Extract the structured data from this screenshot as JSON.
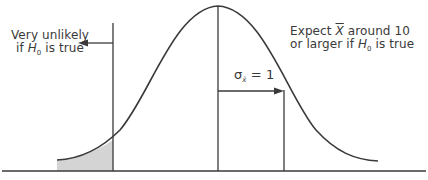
{
  "diagram": {
    "type": "normal-distribution-sampling",
    "left_annotation": {
      "line1": "Very unlikely",
      "line2_prefix": "if ",
      "line2_var": "H",
      "line2_sub": "0",
      "line2_suffix": " is true"
    },
    "right_annotation": {
      "line1_prefix": "Expect ",
      "line1_var": "X",
      "line1_suffix": " around 10",
      "line2_prefix": "or larger if ",
      "line2_var": "H",
      "line2_sub": "0",
      "line2_suffix": " is true"
    },
    "sigma_label": {
      "symbol": "σ",
      "sub": "x̄",
      "eq": " = ",
      "value": "1"
    },
    "colors": {
      "line": "#3a3a3a",
      "shade": "#d4d4d4",
      "background": "#ffffff"
    }
  }
}
